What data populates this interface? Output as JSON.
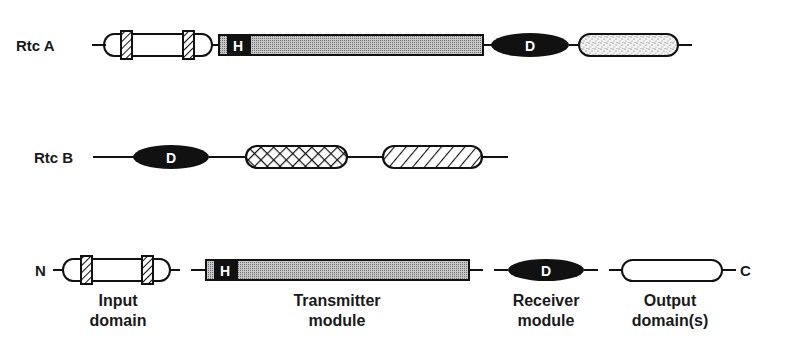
{
  "rows": [
    {
      "label": "Rtc A",
      "domains": [
        "input-domain",
        "transmitter-module",
        "receiver-module",
        "output-domain"
      ],
      "transmitter_letter": "H",
      "receiver_letter": "D",
      "output_fill": "stippled"
    },
    {
      "label": "Rtc B",
      "domains": [
        "receiver-module",
        "output-domain",
        "output-domain"
      ],
      "receiver_letter": "D",
      "output_fills": [
        "crosshatched",
        "diagonal-hatched"
      ]
    },
    {
      "label_n": "N",
      "label_c": "C",
      "domains": [
        "input-domain",
        "transmitter-module",
        "receiver-module",
        "output-domain"
      ],
      "transmitter_letter": "H",
      "receiver_letter": "D",
      "output_fill": "open"
    }
  ],
  "captions": {
    "input": [
      "Input",
      "domain"
    ],
    "transmitter": [
      "Transmitter",
      "module"
    ],
    "receiver": [
      "Receiver",
      "module"
    ],
    "output": [
      "Output",
      "domain(s)"
    ]
  },
  "colors": {
    "ink": "#111111",
    "stipple_gray": "#9a9a9a",
    "background": "#ffffff"
  }
}
